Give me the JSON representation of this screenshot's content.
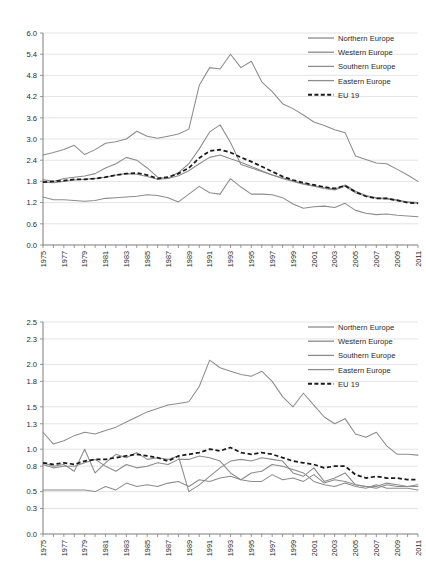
{
  "figure": {
    "panels": [
      "top-chart",
      "bottom-chart"
    ]
  },
  "legend": {
    "items": [
      {
        "label": "Northern Europe",
        "style": "solid",
        "color": "#8c8c8c"
      },
      {
        "label": "Western Europe",
        "style": "solid",
        "color": "#8c8c8c"
      },
      {
        "label": "Southern Europe",
        "style": "solid",
        "color": "#8c8c8c"
      },
      {
        "label": "Eastern Europe",
        "style": "solid",
        "color": "#8c8c8c"
      },
      {
        "label": "EU 19",
        "style": "dashed",
        "color": "#1a1a1a"
      }
    ]
  },
  "chart_data": [
    {
      "id": "top-chart",
      "type": "line",
      "title": "",
      "xlabel": "",
      "ylabel": "",
      "grid": true,
      "legend_position": "top-right",
      "xlim": [
        1975,
        2011
      ],
      "ylim": [
        0.0,
        6.0
      ],
      "yticks": [
        0.0,
        0.6,
        1.2,
        1.8,
        2.4,
        3.0,
        3.6,
        4.2,
        4.8,
        5.4,
        6.0
      ],
      "ytick_labels": [
        "0.0",
        "0.6",
        "1.2",
        "1.8",
        "2.4",
        "3.0",
        "3.6",
        "4.2",
        "4.8",
        "5.4",
        "6.0"
      ],
      "x": [
        1975,
        1976,
        1977,
        1978,
        1979,
        1980,
        1981,
        1982,
        1983,
        1984,
        1985,
        1986,
        1987,
        1988,
        1989,
        1990,
        1991,
        1992,
        1993,
        1994,
        1995,
        1996,
        1997,
        1998,
        1999,
        2000,
        2001,
        2002,
        2003,
        2004,
        2005,
        2006,
        2007,
        2008,
        2009,
        2010,
        2011
      ],
      "xtick_labels": [
        "1975",
        "1977",
        "1979",
        "1981",
        "1983",
        "1985",
        "1987",
        "1989",
        "1991",
        "1993",
        "1995",
        "1997",
        "1999",
        "2001",
        "2003",
        "2005",
        "2007",
        "2009",
        "2011"
      ],
      "series": [
        {
          "name": "Northern Europe",
          "style": "solid",
          "values": [
            1.85,
            1.8,
            1.88,
            1.92,
            1.95,
            2.02,
            2.18,
            2.3,
            2.48,
            2.4,
            2.18,
            1.92,
            1.88,
            2.05,
            2.3,
            2.72,
            3.2,
            3.4,
            2.9,
            2.28,
            2.18,
            2.08,
            1.98,
            1.9,
            1.82,
            1.74,
            1.68,
            1.62,
            1.58,
            1.7,
            1.52,
            1.4,
            1.34,
            1.32,
            1.28,
            1.22,
            1.2
          ]
        },
        {
          "name": "Western Europe",
          "style": "solid",
          "values": [
            1.78,
            1.76,
            1.8,
            1.84,
            1.86,
            1.88,
            1.92,
            1.98,
            2.02,
            2.0,
            1.94,
            1.86,
            1.88,
            1.96,
            2.1,
            2.3,
            2.48,
            2.55,
            2.44,
            2.34,
            2.22,
            2.1,
            1.98,
            1.88,
            1.8,
            1.72,
            1.66,
            1.6,
            1.56,
            1.66,
            1.48,
            1.38,
            1.32,
            1.3,
            1.26,
            1.2,
            1.18
          ]
        },
        {
          "name": "Southern Europe",
          "style": "solid",
          "values": [
            2.55,
            2.62,
            2.7,
            2.82,
            2.56,
            2.7,
            2.88,
            2.92,
            3.0,
            3.22,
            3.08,
            3.02,
            3.08,
            3.14,
            3.28,
            4.52,
            5.02,
            4.98,
            5.4,
            5.02,
            5.2,
            4.62,
            4.34,
            4.0,
            3.86,
            3.68,
            3.48,
            3.38,
            3.26,
            3.18,
            2.52,
            2.42,
            2.32,
            2.3,
            2.14,
            1.98,
            1.8
          ]
        },
        {
          "name": "Eastern Europe",
          "style": "solid",
          "values": [
            1.36,
            1.28,
            1.28,
            1.26,
            1.24,
            1.26,
            1.32,
            1.34,
            1.36,
            1.38,
            1.42,
            1.4,
            1.34,
            1.22,
            1.44,
            1.66,
            1.48,
            1.44,
            1.88,
            1.64,
            1.44,
            1.44,
            1.42,
            1.34,
            1.16,
            1.04,
            1.08,
            1.1,
            1.06,
            1.18,
            0.98,
            0.9,
            0.86,
            0.88,
            0.84,
            0.82,
            0.8
          ]
        },
        {
          "name": "EU 19",
          "style": "dashed",
          "values": [
            1.78,
            1.8,
            1.82,
            1.86,
            1.86,
            1.88,
            1.92,
            1.98,
            2.02,
            2.04,
            1.98,
            1.88,
            1.92,
            2.02,
            2.18,
            2.46,
            2.66,
            2.7,
            2.62,
            2.48,
            2.36,
            2.22,
            2.08,
            1.94,
            1.84,
            1.76,
            1.7,
            1.64,
            1.6,
            1.68,
            1.5,
            1.38,
            1.32,
            1.32,
            1.26,
            1.2,
            1.18
          ]
        }
      ]
    },
    {
      "id": "bottom-chart",
      "type": "line",
      "title": "",
      "xlabel": "",
      "ylabel": "",
      "grid": true,
      "legend_position": "top-right",
      "xlim": [
        1975,
        2011
      ],
      "ylim": [
        0.0,
        2.5
      ],
      "yticks": [
        0.0,
        0.3,
        0.5,
        0.8,
        1.0,
        1.3,
        1.5,
        1.8,
        2.0,
        2.3,
        2.5
      ],
      "ytick_labels": [
        "0.0",
        "0.3",
        "0.5",
        "0.8",
        "1.0",
        "1.3",
        "1.5",
        "1.8",
        "2.0",
        "2.3",
        "2.5"
      ],
      "x": [
        1975,
        1976,
        1977,
        1978,
        1979,
        1980,
        1981,
        1982,
        1983,
        1984,
        1985,
        1986,
        1987,
        1988,
        1989,
        1990,
        1991,
        1992,
        1993,
        1994,
        1995,
        1996,
        1997,
        1998,
        1999,
        2000,
        2001,
        2002,
        2003,
        2004,
        2005,
        2006,
        2007,
        2008,
        2009,
        2010,
        2011
      ],
      "xtick_labels": [
        "1975",
        "1977",
        "1979",
        "1981",
        "1983",
        "1985",
        "1987",
        "1989",
        "1991",
        "1993",
        "1995",
        "1997",
        "1999",
        "2001",
        "2003",
        "2005",
        "2007",
        "2009",
        "2011"
      ],
      "series": [
        {
          "name": "Northern Europe",
          "style": "solid",
          "values": [
            0.84,
            0.8,
            0.82,
            0.74,
            1.0,
            0.72,
            0.84,
            0.94,
            0.9,
            0.96,
            0.88,
            0.9,
            0.88,
            0.92,
            0.5,
            0.58,
            0.68,
            0.78,
            0.86,
            0.88,
            0.86,
            0.9,
            0.88,
            0.86,
            0.72,
            0.68,
            0.78,
            0.62,
            0.66,
            0.72,
            0.58,
            0.56,
            0.56,
            0.6,
            0.58,
            0.56,
            0.58
          ]
        },
        {
          "name": "Western Europe",
          "style": "solid",
          "values": [
            0.82,
            0.78,
            0.8,
            0.8,
            0.84,
            0.88,
            0.8,
            0.74,
            0.82,
            0.78,
            0.8,
            0.84,
            0.82,
            0.88,
            0.88,
            0.92,
            0.9,
            0.86,
            0.72,
            0.64,
            0.62,
            0.62,
            0.7,
            0.64,
            0.66,
            0.62,
            0.7,
            0.6,
            0.64,
            0.62,
            0.58,
            0.56,
            0.54,
            0.58,
            0.56,
            0.56,
            0.56
          ]
        },
        {
          "name": "Southern Europe",
          "style": "solid",
          "values": [
            1.2,
            1.06,
            1.1,
            1.16,
            1.2,
            1.18,
            1.22,
            1.26,
            1.32,
            1.38,
            1.44,
            1.48,
            1.52,
            1.54,
            1.56,
            1.74,
            2.05,
            1.96,
            1.92,
            1.88,
            1.86,
            1.92,
            1.8,
            1.62,
            1.5,
            1.66,
            1.52,
            1.38,
            1.3,
            1.36,
            1.18,
            1.14,
            1.2,
            1.04,
            0.94,
            0.94,
            0.93
          ]
        },
        {
          "name": "Eastern Europe",
          "style": "solid",
          "values": [
            0.52,
            0.52,
            0.52,
            0.52,
            0.52,
            0.5,
            0.56,
            0.52,
            0.6,
            0.56,
            0.58,
            0.56,
            0.6,
            0.62,
            0.56,
            0.64,
            0.62,
            0.66,
            0.68,
            0.64,
            0.72,
            0.74,
            0.82,
            0.8,
            0.76,
            0.72,
            0.62,
            0.58,
            0.56,
            0.6,
            0.56,
            0.54,
            0.58,
            0.54,
            0.54,
            0.54,
            0.52
          ]
        },
        {
          "name": "EU 19",
          "style": "dashed",
          "values": [
            0.84,
            0.82,
            0.84,
            0.82,
            0.86,
            0.88,
            0.88,
            0.9,
            0.92,
            0.94,
            0.92,
            0.9,
            0.86,
            0.92,
            0.94,
            0.96,
            1.0,
            0.98,
            1.02,
            0.96,
            0.94,
            0.96,
            0.94,
            0.9,
            0.86,
            0.84,
            0.82,
            0.78,
            0.8,
            0.8,
            0.7,
            0.66,
            0.68,
            0.66,
            0.66,
            0.64,
            0.64
          ]
        }
      ]
    }
  ]
}
